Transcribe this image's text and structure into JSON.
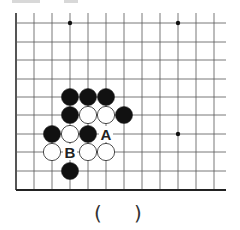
{
  "diagram": {
    "type": "go-board-problem",
    "grid": {
      "x_lines": [
        16,
        34,
        52,
        70,
        88,
        106,
        124,
        142,
        160,
        178,
        196,
        214
      ],
      "y_lines": [
        23,
        42,
        60,
        79,
        97,
        115,
        134,
        152,
        171,
        190
      ],
      "right_extent": 226,
      "left_edge_bold": true,
      "bottom_edge_bold": true,
      "line_color": "#555555"
    },
    "star_points": [
      [
        70,
        23
      ],
      [
        178,
        23
      ],
      [
        178,
        134
      ]
    ],
    "stones": [
      {
        "col": 3,
        "row": 4,
        "color": "black"
      },
      {
        "col": 4,
        "row": 4,
        "color": "black"
      },
      {
        "col": 5,
        "row": 4,
        "color": "black"
      },
      {
        "col": 3,
        "row": 5,
        "color": "black"
      },
      {
        "col": 4,
        "row": 5,
        "color": "white"
      },
      {
        "col": 5,
        "row": 5,
        "color": "white"
      },
      {
        "col": 6,
        "row": 5,
        "color": "black"
      },
      {
        "col": 2,
        "row": 6,
        "color": "black"
      },
      {
        "col": 3,
        "row": 6,
        "color": "white"
      },
      {
        "col": 4,
        "row": 6,
        "color": "black"
      },
      {
        "col": 2,
        "row": 7,
        "color": "white"
      },
      {
        "col": 4,
        "row": 7,
        "color": "white"
      },
      {
        "col": 5,
        "row": 7,
        "color": "white"
      },
      {
        "col": 3,
        "row": 8,
        "color": "black"
      }
    ],
    "labels": [
      {
        "text": "A",
        "col": 5,
        "row": 6
      },
      {
        "text": "B",
        "col": 3,
        "row": 7
      }
    ],
    "answer_blank": {
      "open": "(",
      "close": ")"
    }
  }
}
